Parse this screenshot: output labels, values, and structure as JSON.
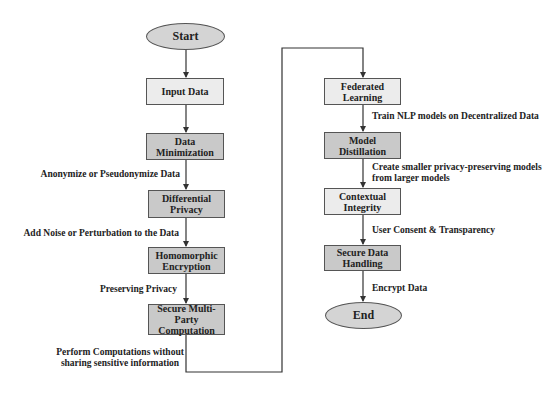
{
  "diagram": {
    "type": "flowchart",
    "colors": {
      "line": "#333333",
      "box_border": "#555555",
      "light_fill": "#ececec",
      "dark_fill": "#c9c9c9",
      "terminal_fill": "#d4d4d4"
    },
    "nodes": {
      "start": "Start",
      "input_data": "Input Data",
      "data_minimization": [
        "Data",
        "Minimization"
      ],
      "differential_privacy": [
        "Differential",
        "Privacy"
      ],
      "homomorphic_encryption": [
        "Homomorphic",
        "Encryption"
      ],
      "secure_mpc": [
        "Secure Multi-Party",
        "Computation"
      ],
      "federated_learning": [
        "Federated",
        "Learning"
      ],
      "model_distillation": [
        "Model",
        "Distillation"
      ],
      "contextual_integrity": [
        "Contextual",
        "Integrity"
      ],
      "secure_data_handling": [
        "Secure Data",
        "Handling"
      ],
      "end": "End"
    },
    "edge_labels": {
      "anonymize": "Anonymize or Pseudonymize Data",
      "add_noise": "Add Noise or Perturbation to the Data",
      "preserving": "Preserving Privacy",
      "perform_computations": [
        "Perform Computations without",
        "sharing sensitive information"
      ],
      "train_nlp": "Train NLP models on Decentralized Data",
      "create_smaller": [
        "Create smaller privacy-preserving models",
        "from larger models"
      ],
      "user_consent": "User Consent & Transparency",
      "encrypt": "Encrypt Data"
    }
  }
}
